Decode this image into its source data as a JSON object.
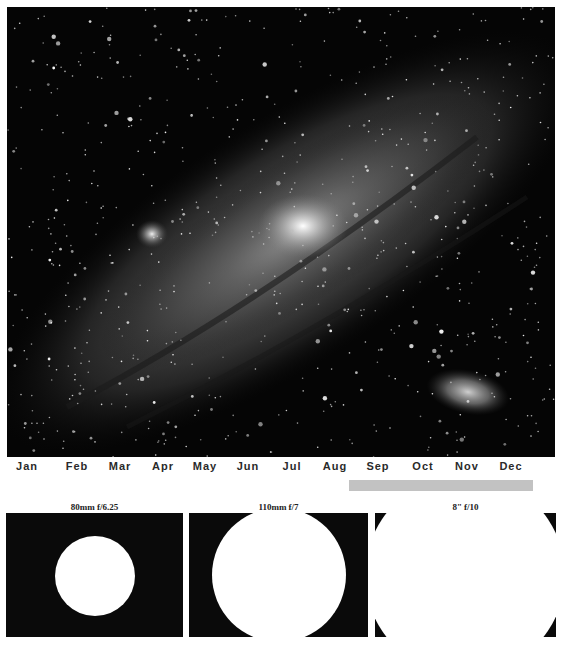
{
  "photo": {
    "subject": "andromeda-galaxy",
    "background_color": "#050505",
    "features": [
      {
        "name": "core",
        "x": 296,
        "y": 219
      },
      {
        "name": "m32",
        "x": 145,
        "y": 227
      },
      {
        "name": "m110",
        "x": 461,
        "y": 385
      }
    ]
  },
  "timeline": {
    "months": [
      {
        "label": "Jan",
        "x": 27
      },
      {
        "label": "Feb",
        "x": 77
      },
      {
        "label": "Mar",
        "x": 120
      },
      {
        "label": "Apr",
        "x": 163
      },
      {
        "label": "May",
        "x": 205
      },
      {
        "label": "Jun",
        "x": 248
      },
      {
        "label": "Jul",
        "x": 292
      },
      {
        "label": "Aug",
        "x": 335
      },
      {
        "label": "Sep",
        "x": 378
      },
      {
        "label": "Oct",
        "x": 423
      },
      {
        "label": "Nov",
        "x": 467
      },
      {
        "label": "Dec",
        "x": 511
      }
    ],
    "visibility_bar": {
      "start_x": 349,
      "end_x": 533,
      "color": "#c2c2c2",
      "range": "Aug–Dec"
    }
  },
  "panels": [
    {
      "label": "80mm f/6.25",
      "left": 6,
      "width": 177,
      "circle": {
        "cx": 89,
        "cy": 63,
        "r": 40
      }
    },
    {
      "label": "110mm f/7",
      "left": 189,
      "width": 179,
      "circle": {
        "cx": 90,
        "cy": 62,
        "r": 67
      }
    },
    {
      "label": "8\" f/10",
      "left": 375,
      "width": 181,
      "circle": {
        "cx": 90,
        "cy": 62,
        "r": 100
      }
    }
  ]
}
